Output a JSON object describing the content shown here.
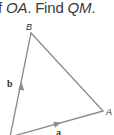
{
  "question": {
    "prefix": "f ",
    "seg1": "OA",
    "mid": ". Find ",
    "seg2": "QM",
    "suffix": "."
  },
  "figure": {
    "type": "vector triangle",
    "line_color": "#8c8c8c",
    "vertices": {
      "B": {
        "label": "B",
        "x": 31,
        "y": 33
      },
      "A": {
        "label": "A",
        "x": 103,
        "y": 111
      },
      "O": {
        "label": "",
        "x": 10,
        "y": 137
      }
    },
    "vectors": [
      {
        "label": "b",
        "from": "O",
        "to": "B"
      },
      {
        "label": "a",
        "from": "O",
        "to": "A"
      }
    ]
  }
}
